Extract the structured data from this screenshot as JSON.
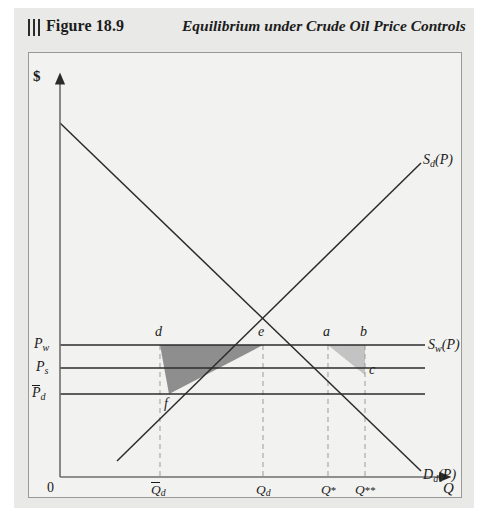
{
  "header": {
    "figure_number": "Figure 18.9",
    "title": "Equilibrium under Crude Oil Price Controls",
    "rule_marks": 3
  },
  "axes": {
    "y_label": "$",
    "x_label": "Q",
    "origin_label": "0"
  },
  "price_ticks": [
    {
      "id": "Pw",
      "base": "P",
      "subscript": "w",
      "overbar": false,
      "y": 292
    },
    {
      "id": "Ps",
      "base": "P",
      "subscript": "s",
      "overbar": false,
      "y": 315
    },
    {
      "id": "Pdbar",
      "base": "P",
      "subscript": "d",
      "overbar": true,
      "y": 341
    }
  ],
  "quantity_ticks": [
    {
      "id": "Qdbar",
      "base": "Q",
      "subscript": "d",
      "overbar": true,
      "x": 137
    },
    {
      "id": "Qd",
      "base": "Q",
      "subscript": "d",
      "overbar": false,
      "x": 240
    },
    {
      "id": "Qstar",
      "base": "Q",
      "superscript": "*",
      "overbar": false,
      "x": 305
    },
    {
      "id": "Qstar2",
      "base": "Q",
      "superscript": "**",
      "overbar": false,
      "x": 340
    }
  ],
  "curves": [
    {
      "id": "Sd",
      "label_base": "S",
      "label_sub": "d",
      "label_arg": "(P)",
      "name": "domestic-supply"
    },
    {
      "id": "Sw",
      "label_base": "S",
      "label_sub": "w",
      "label_arg": "(P)",
      "name": "world-supply"
    },
    {
      "id": "Dd",
      "label_base": "D",
      "label_sub": "d",
      "label_arg": "(P)",
      "name": "domestic-demand"
    }
  ],
  "points": [
    {
      "id": "d",
      "label": "d",
      "x": 131,
      "y": 281
    },
    {
      "id": "e",
      "label": "e",
      "x": 234,
      "y": 281
    },
    {
      "id": "a",
      "label": "a",
      "x": 299,
      "y": 281
    },
    {
      "id": "b",
      "label": "b",
      "x": 336,
      "y": 281
    },
    {
      "id": "c",
      "label": "c",
      "x": 345,
      "y": 318
    },
    {
      "id": "f",
      "label": "f",
      "x": 140,
      "y": 352
    }
  ],
  "colors": {
    "page_background": "#ffffff",
    "figure_background": "#e9e9e7",
    "plot_background": "#f2f2f0",
    "frame_border": "#9a9a96",
    "line": "#2b2b2b",
    "dashed_guide": "#9b9b97",
    "shade_dark": "#8e8e8e",
    "shade_light": "#c3c3c3",
    "text": "#1a1a1a"
  }
}
